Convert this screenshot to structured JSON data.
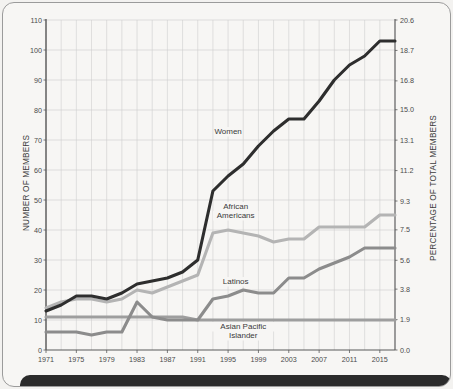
{
  "chart_data": {
    "type": "line",
    "title": "",
    "xlabel": "",
    "ylabel": "NUMBER OF MEMBERS",
    "y2label": "PERCENTAGE OF TOTAL MEMBERS",
    "grid": true,
    "legend_position": "inline-annotations",
    "xlim": [
      1971,
      2017
    ],
    "ylim": [
      0,
      110
    ],
    "y2lim": [
      0.0,
      20.6
    ],
    "xticks": [
      "1971",
      "1975",
      "1979",
      "1983",
      "1987",
      "1991",
      "1995",
      "1999",
      "2003",
      "2007",
      "2011",
      "2015"
    ],
    "xtick_values": [
      1971,
      1975,
      1979,
      1983,
      1987,
      1991,
      1995,
      1999,
      2003,
      2007,
      2011,
      2015
    ],
    "gridline_years": [
      1973,
      1975,
      1977,
      1979,
      1981,
      1983,
      1985,
      1987,
      1989,
      1991,
      1993,
      1995,
      1997,
      1999,
      2001,
      2003,
      2005,
      2007,
      2009,
      2011,
      2013,
      2015,
      2017
    ],
    "yticks": [
      "0",
      "10",
      "20",
      "30",
      "40",
      "50",
      "60",
      "70",
      "80",
      "90",
      "100",
      "110"
    ],
    "ytick_values": [
      0,
      10,
      20,
      30,
      40,
      50,
      60,
      70,
      80,
      90,
      100,
      110
    ],
    "y2ticks": [
      "0.0",
      "1.9",
      "3.8",
      "5.6",
      "7.5",
      "9.3",
      "11.2",
      "13.1",
      "15.0",
      "16.8",
      "18.7",
      "20.6"
    ],
    "y2tick_values": [
      0.0,
      1.9,
      3.8,
      5.6,
      7.5,
      9.3,
      11.2,
      13.1,
      15.0,
      16.8,
      18.7,
      20.6
    ],
    "x": [
      1971,
      1973,
      1975,
      1977,
      1979,
      1981,
      1983,
      1985,
      1987,
      1989,
      1991,
      1993,
      1995,
      1997,
      1999,
      2001,
      2003,
      2005,
      2007,
      2009,
      2011,
      2013,
      2015,
      2017
    ],
    "series": [
      {
        "name": "Women",
        "color": "#2e2e2e",
        "values": [
          13,
          15,
          18,
          18,
          17,
          19,
          22,
          23,
          24,
          26,
          30,
          53,
          58,
          62,
          68,
          73,
          77,
          77,
          83,
          90,
          95,
          98,
          103,
          103
        ]
      },
      {
        "name": "African Americans",
        "color": "#b4b4b4",
        "values": [
          14,
          16,
          17,
          17,
          16,
          17,
          20,
          19,
          21,
          23,
          25,
          39,
          40,
          39,
          38,
          36,
          37,
          37,
          41,
          41,
          41,
          41,
          45,
          45
        ]
      },
      {
        "name": "Latinos",
        "color": "#8c8c8c",
        "values": [
          6,
          6,
          6,
          5,
          6,
          6,
          16,
          11,
          10,
          10,
          10,
          17,
          18,
          20,
          19,
          19,
          24,
          24,
          27,
          29,
          31,
          34,
          34,
          34
        ]
      },
      {
        "name": "Asian Pacific Islander",
        "color": "#9e9e9e",
        "values": [
          11,
          11,
          11,
          11,
          11,
          11,
          11,
          11,
          11,
          11,
          10,
          10,
          10,
          10,
          10,
          10,
          10,
          10,
          10,
          10,
          10,
          10,
          10,
          10
        ]
      }
    ],
    "annotations": [
      {
        "text": "Women",
        "x": 1995,
        "y": 72
      },
      {
        "text": "African",
        "x": 1996,
        "y": 47
      },
      {
        "text": "Americans",
        "x": 1996,
        "y": 44
      },
      {
        "text": "Latinos",
        "x": 1996,
        "y": 22
      },
      {
        "text": "Asian Pacific",
        "x": 1997,
        "y": 7
      },
      {
        "text": "Islander",
        "x": 1997,
        "y": 4
      }
    ]
  },
  "axes": {
    "left_title": "NUMBER OF MEMBERS",
    "right_title": "PERCENTAGE OF TOTAL MEMBERS"
  }
}
